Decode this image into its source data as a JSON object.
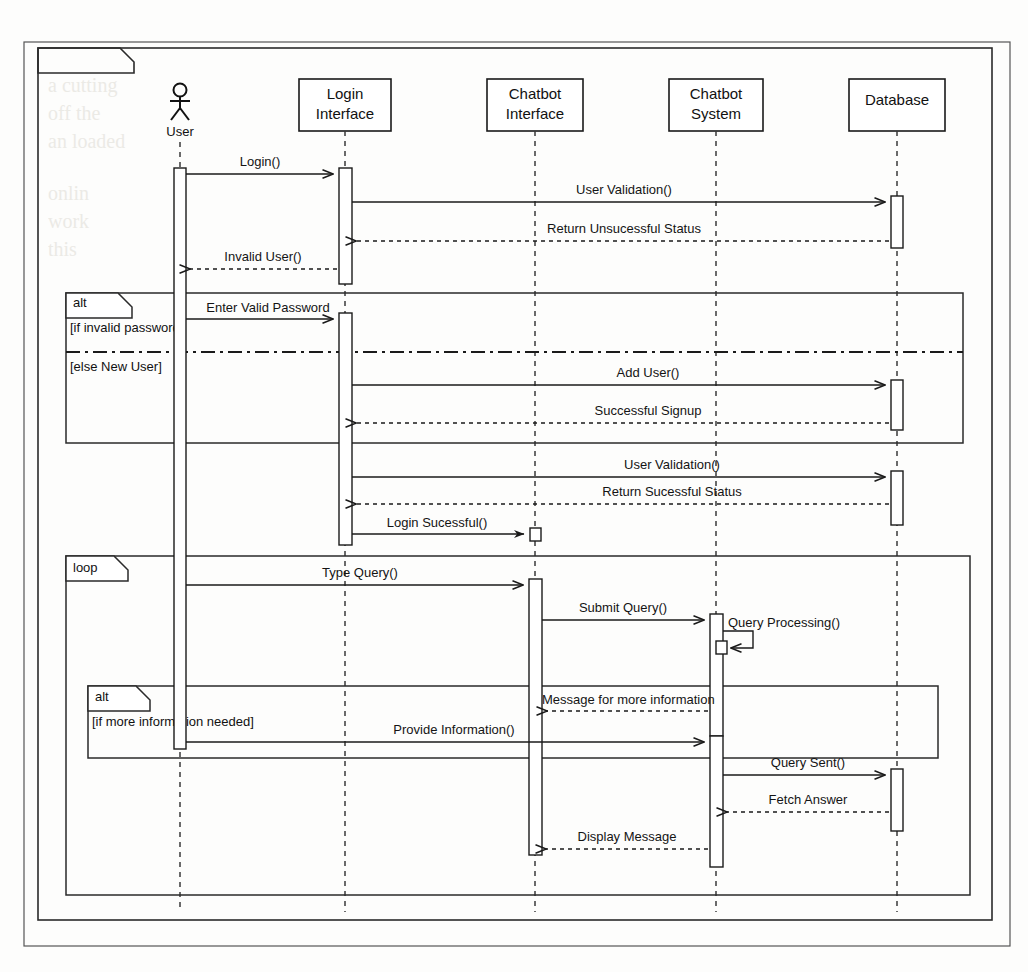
{
  "diagram": {
    "frame_label": "sd sequence",
    "kind": "uml-sequence-diagram",
    "bleed_text_top": "use of the same of system and its working."
  },
  "participants": [
    {
      "id": "user",
      "name": "User",
      "type": "actor",
      "x": 180
    },
    {
      "id": "login",
      "name": "Login\nInterface",
      "line1": "Login",
      "line2": "Interface",
      "type": "object",
      "x": 345
    },
    {
      "id": "chatbot_ui",
      "name": "Chatbot\nInterface",
      "line1": "Chatbot",
      "line2": "Interface",
      "type": "object",
      "x": 535
    },
    {
      "id": "chatbot_sys",
      "name": "Chatbot\nSystem",
      "line1": "Chatbot",
      "line2": "System",
      "type": "object",
      "x": 716
    },
    {
      "id": "database",
      "name": "Database",
      "line1": "Database",
      "line2": "",
      "type": "object",
      "x": 897
    }
  ],
  "fragments": [
    {
      "id": "alt-login",
      "operator": "alt",
      "guards": [
        "[if invalid password]",
        "[else New User]"
      ]
    },
    {
      "id": "loop-chat",
      "operator": "loop",
      "guards": []
    },
    {
      "id": "alt-moreinfo",
      "operator": "alt",
      "guards": [
        "[if more information needed]"
      ]
    }
  ],
  "messages": [
    {
      "seq": 1,
      "label": "Login()",
      "from": "user",
      "to": "login",
      "kind": "sync"
    },
    {
      "seq": 2,
      "label": "User Validation()",
      "from": "login",
      "to": "database",
      "kind": "sync"
    },
    {
      "seq": 3,
      "label": "Return Unsucessful Status",
      "from": "database",
      "to": "login",
      "kind": "return"
    },
    {
      "seq": 4,
      "label": "Invalid User()",
      "from": "login",
      "to": "user",
      "kind": "return"
    },
    {
      "seq": 5,
      "label": "Enter Valid Password",
      "from": "user",
      "to": "login",
      "kind": "sync"
    },
    {
      "seq": 6,
      "label": "Add User()",
      "from": "login",
      "to": "database",
      "kind": "sync"
    },
    {
      "seq": 7,
      "label": "Successful Signup",
      "from": "database",
      "to": "login",
      "kind": "return"
    },
    {
      "seq": 8,
      "label": "User Validation()",
      "from": "login",
      "to": "database",
      "kind": "sync"
    },
    {
      "seq": 9,
      "label": "Return Sucessful Status",
      "from": "database",
      "to": "login",
      "kind": "return"
    },
    {
      "seq": 10,
      "label": "Login Sucessful()",
      "from": "login",
      "to": "chatbot_ui",
      "kind": "sync"
    },
    {
      "seq": 11,
      "label": "Type Query()",
      "from": "user",
      "to": "chatbot_ui",
      "kind": "sync"
    },
    {
      "seq": 12,
      "label": "Submit Query()",
      "from": "chatbot_ui",
      "to": "chatbot_sys",
      "kind": "sync"
    },
    {
      "seq": 13,
      "label": "Query Processing()",
      "from": "chatbot_sys",
      "to": "chatbot_sys",
      "kind": "self"
    },
    {
      "seq": 14,
      "label": "Message for more information",
      "from": "chatbot_sys",
      "to": "chatbot_ui",
      "kind": "return"
    },
    {
      "seq": 15,
      "label": "Provide Information()",
      "from": "user",
      "to": "chatbot_sys",
      "kind": "sync"
    },
    {
      "seq": 16,
      "label": "Query Sent()",
      "from": "chatbot_sys",
      "to": "database",
      "kind": "sync"
    },
    {
      "seq": 17,
      "label": "Fetch Answer",
      "from": "database",
      "to": "chatbot_sys",
      "kind": "return"
    },
    {
      "seq": 18,
      "label": "Display Message",
      "from": "chatbot_sys",
      "to": "chatbot_ui",
      "kind": "return"
    }
  ],
  "colors": {
    "line": "#1a1a1a",
    "frame": "#2a2a2a",
    "background": "#fdfdfc",
    "lifeline": "#3a3a3a",
    "activation_fill": "#ffffff"
  }
}
